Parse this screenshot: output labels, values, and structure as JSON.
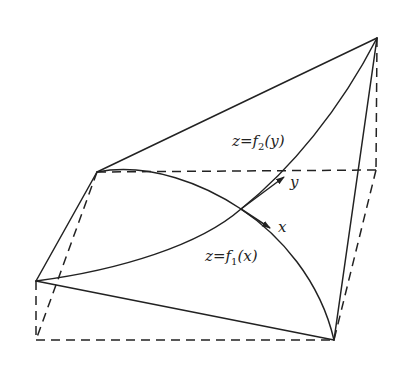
{
  "diagram": {
    "type": "3d-surface-sketch",
    "colors": {
      "stroke": "#222222",
      "background": "#ffffff"
    },
    "labels": {
      "surface_top": {
        "text": "z=f",
        "sub": "2",
        "arg": "(y)"
      },
      "surface_bottom": {
        "text": "z=f",
        "sub": "1",
        "arg": "(x)"
      },
      "axis_y": "y",
      "axis_x": "x"
    },
    "points": {
      "A_top_left": [
        97,
        172
      ],
      "B_top_right": [
        377,
        38
      ],
      "C_left": [
        36,
        281
      ],
      "D_bottom_right": [
        334,
        340
      ],
      "E_bottom_left": [
        36,
        340
      ],
      "F_back_right": [
        376,
        170
      ],
      "O_origin": [
        241,
        209
      ]
    }
  }
}
